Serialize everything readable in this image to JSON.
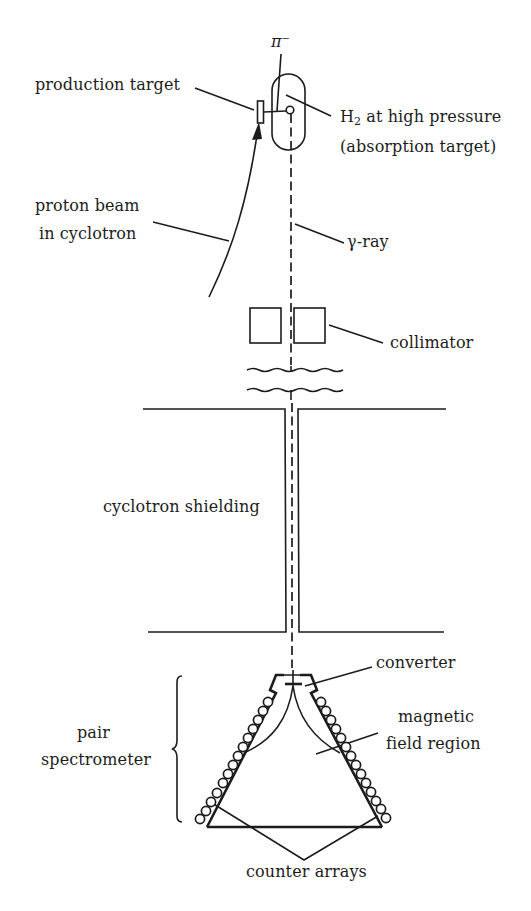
{
  "figure": {
    "type": "experimental apparatus schematic",
    "colors": {
      "ink": "#1c1c1c",
      "background": "#ffffff"
    }
  },
  "labels": {
    "pion": "π⁻",
    "production_target": "production target",
    "h2_prefix": "H",
    "h2_sub": "2",
    "h2_suffix": " at high pressure",
    "absorption_target": "(absorption target)",
    "proton_beam_line1": "proton beam",
    "proton_beam_line2": "in cyclotron",
    "gamma_ray": "γ-ray",
    "collimator": "collimator",
    "cyclotron_shielding": "cyclotron shielding",
    "converter": "converter",
    "magnetic_line1": "magnetic",
    "magnetic_line2": "field region",
    "pair_line1": "pair",
    "pair_line2": "spectrometer",
    "counter_arrays": "counter arrays"
  },
  "components": {
    "counter_arrays": {
      "left_count": 14,
      "right_count": 14
    }
  }
}
